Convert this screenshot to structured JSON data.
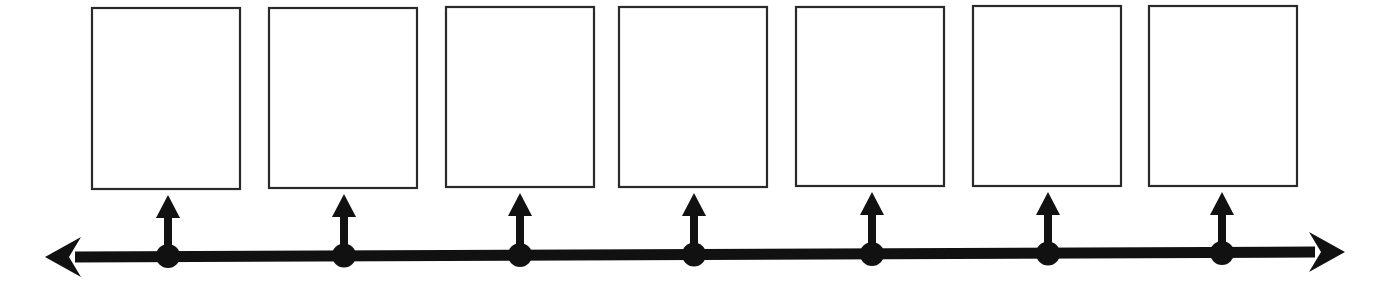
{
  "diagram": {
    "type": "timeline",
    "line_color": "#111111",
    "box_border_color": "#2a2a2a",
    "box_fill": "#ffffff",
    "axis": {
      "x1": 45,
      "y1": 257,
      "x2": 1345,
      "y2": 252,
      "thickness": 11,
      "left_arrow": true,
      "right_arrow": true
    },
    "events": [
      {
        "label": "",
        "box": {
          "x": 91,
          "y": 7,
          "w": 150,
          "h": 183
        },
        "dot_x": 168,
        "dot_y": 256
      },
      {
        "label": "",
        "box": {
          "x": 268,
          "y": 7,
          "w": 150,
          "h": 182
        },
        "dot_x": 344,
        "dot_y": 255.5
      },
      {
        "label": "",
        "box": {
          "x": 445,
          "y": 6,
          "w": 150,
          "h": 182
        },
        "dot_x": 520,
        "dot_y": 255
      },
      {
        "label": "",
        "box": {
          "x": 618,
          "y": 6,
          "w": 150,
          "h": 182
        },
        "dot_x": 694,
        "dot_y": 254.5
      },
      {
        "label": "",
        "box": {
          "x": 795,
          "y": 6,
          "w": 150,
          "h": 181
        },
        "dot_x": 872,
        "dot_y": 254
      },
      {
        "label": "",
        "box": {
          "x": 972,
          "y": 5,
          "w": 150,
          "h": 182
        },
        "dot_x": 1048,
        "dot_y": 253.5
      },
      {
        "label": "",
        "box": {
          "x": 1148,
          "y": 5,
          "w": 150,
          "h": 182
        },
        "dot_x": 1222,
        "dot_y": 253
      }
    ]
  }
}
